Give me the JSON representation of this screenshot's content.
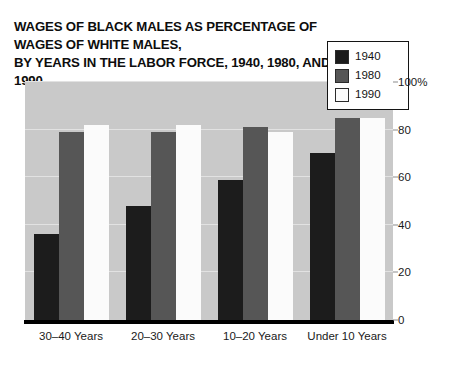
{
  "chart_data": {
    "type": "bar",
    "title": "WAGES OF BLACK MALES AS PERCENTAGE OF WAGES OF WHITE MALES,\nBY YEARS IN THE LABOR FORCE, 1940, 1980, AND 1990",
    "xlabel": "",
    "ylabel": "",
    "ylim": [
      0,
      100
    ],
    "yticks": [
      0,
      20,
      40,
      60,
      80,
      100
    ],
    "ytick_labels": [
      "0",
      "20",
      "40",
      "60",
      "80",
      "100%"
    ],
    "grid": true,
    "legend_position": "top-right",
    "categories": [
      "30–40 Years",
      "20–30 Years",
      "10–20 Years",
      "Under 10 Years"
    ],
    "series": [
      {
        "name": "1940",
        "color": "#1c1c1c",
        "values": [
          36,
          48,
          59,
          70
        ]
      },
      {
        "name": "1980",
        "color": "#565656",
        "values": [
          79,
          79,
          81,
          85
        ]
      },
      {
        "name": "1990",
        "color": "#fbfbfb",
        "values": [
          82,
          82,
          79,
          85
        ]
      }
    ]
  },
  "legend": {
    "items": [
      {
        "label": "1940",
        "swatch": "#1c1c1c"
      },
      {
        "label": "1980",
        "swatch": "#565656"
      },
      {
        "label": "1990",
        "swatch": "#fbfbfb"
      }
    ]
  },
  "colors": {
    "plot_background": "#c9c9c9",
    "gridline": "#e2e2e2",
    "axis": "#000000",
    "text": "#111111"
  }
}
